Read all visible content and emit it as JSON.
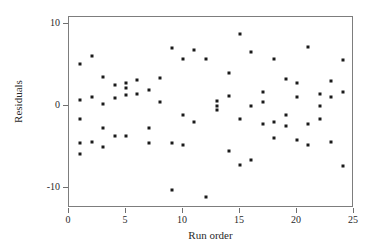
{
  "chart_data": {
    "type": "scatter",
    "title": "",
    "xlabel": "Run order",
    "ylabel": "Residuals",
    "xlim": [
      0,
      25
    ],
    "ylim": [
      -12.5,
      10.8
    ],
    "grid": false,
    "legend": null,
    "xticks": [
      0,
      5,
      10,
      15,
      20,
      25
    ],
    "yticks": [
      10,
      0,
      -10
    ],
    "xtick_labels": [
      "0",
      "5",
      "10",
      "15",
      "20",
      "25"
    ],
    "ytick_labels": [
      "10",
      "0",
      "-10"
    ],
    "marker": "square",
    "marker_color": "#1a1a1a",
    "points": [
      {
        "x": 1,
        "y": 5.1
      },
      {
        "x": 1,
        "y": 0.7
      },
      {
        "x": 1,
        "y": -1.6
      },
      {
        "x": 1,
        "y": -4.6
      },
      {
        "x": 1,
        "y": -5.9
      },
      {
        "x": 2,
        "y": 6.1
      },
      {
        "x": 2,
        "y": 1.1
      },
      {
        "x": 2,
        "y": -4.5
      },
      {
        "x": 3,
        "y": 3.5
      },
      {
        "x": 3,
        "y": 0.2
      },
      {
        "x": 3,
        "y": -2.7
      },
      {
        "x": 3,
        "y": -5.0
      },
      {
        "x": 4,
        "y": 2.5
      },
      {
        "x": 4,
        "y": 0.9
      },
      {
        "x": 4,
        "y": -3.7
      },
      {
        "x": 5,
        "y": 2.7
      },
      {
        "x": 5,
        "y": 2.1
      },
      {
        "x": 5,
        "y": 1.3
      },
      {
        "x": 5,
        "y": -3.7
      },
      {
        "x": 6,
        "y": 3.1
      },
      {
        "x": 6,
        "y": 1.4
      },
      {
        "x": 7,
        "y": 1.9
      },
      {
        "x": 7,
        "y": -2.7
      },
      {
        "x": 7,
        "y": -4.6
      },
      {
        "x": 8,
        "y": 3.3
      },
      {
        "x": 8,
        "y": 0.4
      },
      {
        "x": 9,
        "y": 7.0
      },
      {
        "x": 9,
        "y": -4.6
      },
      {
        "x": 9,
        "y": -10.3
      },
      {
        "x": 10,
        "y": 5.7
      },
      {
        "x": 10,
        "y": -1.2
      },
      {
        "x": 10,
        "y": -4.8
      },
      {
        "x": 11,
        "y": 6.8
      },
      {
        "x": 11,
        "y": -2.0
      },
      {
        "x": 12,
        "y": 5.7
      },
      {
        "x": 12,
        "y": -11.2
      },
      {
        "x": 13,
        "y": 0.5
      },
      {
        "x": 13,
        "y": 0.0
      },
      {
        "x": 13,
        "y": -0.6
      },
      {
        "x": 14,
        "y": 4.0
      },
      {
        "x": 14,
        "y": 1.2
      },
      {
        "x": 14,
        "y": -5.5
      },
      {
        "x": 15,
        "y": 8.7
      },
      {
        "x": 15,
        "y": -1.6
      },
      {
        "x": 15,
        "y": -7.2
      },
      {
        "x": 16,
        "y": 6.5
      },
      {
        "x": 16,
        "y": -0.1
      },
      {
        "x": 16,
        "y": -6.7
      },
      {
        "x": 17,
        "y": 1.6
      },
      {
        "x": 17,
        "y": 0.4
      },
      {
        "x": 17,
        "y": -2.3
      },
      {
        "x": 18,
        "y": 5.7
      },
      {
        "x": 18,
        "y": -2.0
      },
      {
        "x": 18,
        "y": -3.9
      },
      {
        "x": 19,
        "y": 3.2
      },
      {
        "x": 19,
        "y": -1.1
      },
      {
        "x": 19,
        "y": -2.5
      },
      {
        "x": 20,
        "y": 2.8
      },
      {
        "x": 20,
        "y": 1.0
      },
      {
        "x": 20,
        "y": -4.2
      },
      {
        "x": 21,
        "y": 7.2
      },
      {
        "x": 21,
        "y": -2.3
      },
      {
        "x": 21,
        "y": -4.8
      },
      {
        "x": 22,
        "y": 1.4
      },
      {
        "x": 22,
        "y": 0.0
      },
      {
        "x": 22,
        "y": -1.6
      },
      {
        "x": 23,
        "y": 3.0
      },
      {
        "x": 23,
        "y": 1.1
      },
      {
        "x": 23,
        "y": -4.5
      },
      {
        "x": 24,
        "y": 5.5
      },
      {
        "x": 24,
        "y": 1.7
      },
      {
        "x": 24,
        "y": -7.4
      }
    ]
  }
}
